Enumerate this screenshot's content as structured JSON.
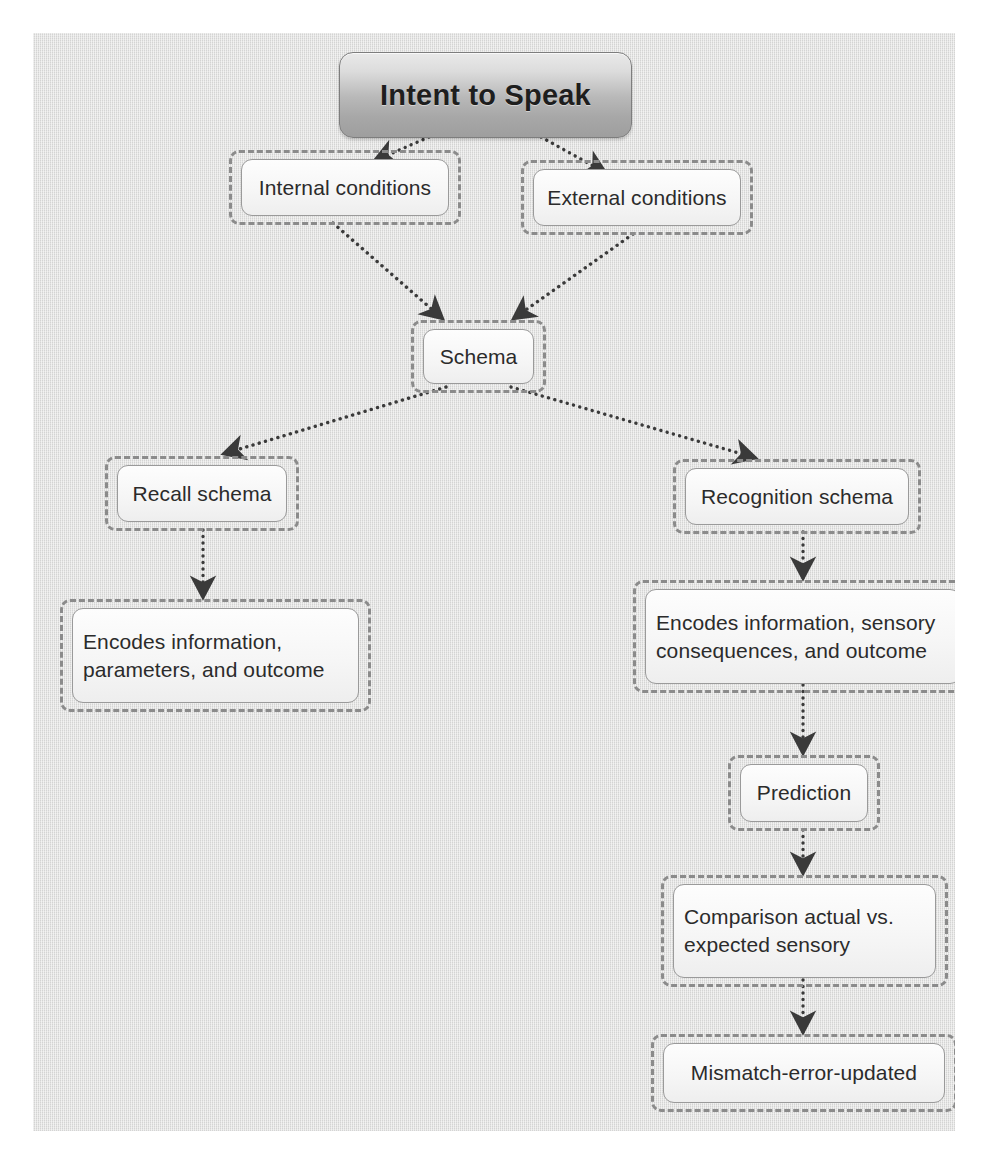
{
  "diagram": {
    "title": "Intent to Speak",
    "background_color": "#dcdcdb",
    "node_border_color": "#8b8b8b",
    "connector_color": "#3f3f3f",
    "nodes": [
      {
        "id": "root",
        "label": "Intent to Speak"
      },
      {
        "id": "internal",
        "label": "Internal conditions"
      },
      {
        "id": "external",
        "label": "External conditions"
      },
      {
        "id": "schema",
        "label": "Schema"
      },
      {
        "id": "recall",
        "label": "Recall schema"
      },
      {
        "id": "recognition",
        "label": "Recognition schema"
      },
      {
        "id": "recall-encodes",
        "label": "Encodes information,\nparameters, and outcome"
      },
      {
        "id": "recog-encodes",
        "label": "Encodes information, sensory\nconsequences, and outcome"
      },
      {
        "id": "prediction",
        "label": "Prediction"
      },
      {
        "id": "comparison",
        "label": "Comparison actual vs.\nexpected sensory"
      },
      {
        "id": "mismatch",
        "label": "Mismatch-error-updated"
      }
    ],
    "edges": [
      {
        "from": "root",
        "to": "internal"
      },
      {
        "from": "root",
        "to": "external"
      },
      {
        "from": "internal",
        "to": "schema"
      },
      {
        "from": "external",
        "to": "schema"
      },
      {
        "from": "schema",
        "to": "recall"
      },
      {
        "from": "schema",
        "to": "recognition"
      },
      {
        "from": "recall",
        "to": "recall-encodes"
      },
      {
        "from": "recognition",
        "to": "recog-encodes"
      },
      {
        "from": "recog-encodes",
        "to": "prediction"
      },
      {
        "from": "prediction",
        "to": "comparison"
      },
      {
        "from": "comparison",
        "to": "mismatch"
      }
    ]
  }
}
